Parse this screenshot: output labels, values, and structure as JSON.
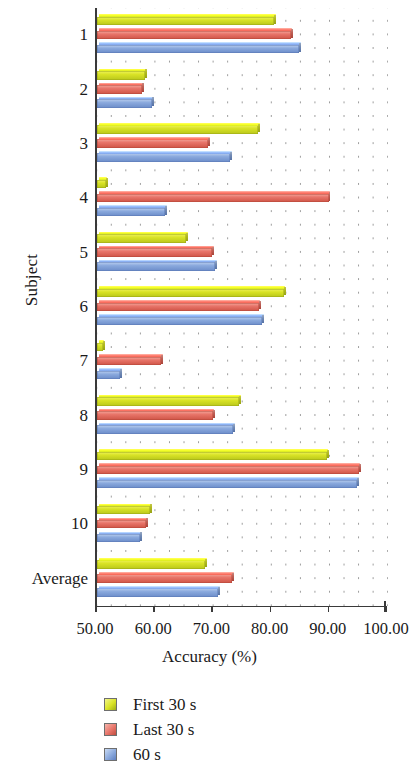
{
  "chart_data": {
    "type": "bar",
    "orientation": "horizontal",
    "title": "",
    "xlabel": "Accuracy (%)",
    "ylabel": "Subject",
    "xlim": [
      50.0,
      100.0
    ],
    "xticks": [
      50.0,
      60.0,
      70.0,
      80.0,
      90.0,
      100.0
    ],
    "xtick_labels": [
      "50.00",
      "60.00",
      "70.00",
      "80.00",
      "90.00",
      "100.00"
    ],
    "grid": "dotted",
    "legend_position": "below",
    "categories": [
      "1",
      "2",
      "3",
      "4",
      "5",
      "6",
      "7",
      "8",
      "9",
      "10",
      "Average"
    ],
    "series": [
      {
        "name": "First 30 s",
        "color": "#d9e326",
        "values": [
          80.4,
          58.2,
          77.7,
          51.5,
          65.3,
          82.1,
          51.0,
          74.4,
          89.5,
          59.1,
          68.6
        ]
      },
      {
        "name": "Last 30 s",
        "color": "#e8756a",
        "values": [
          83.3,
          57.7,
          69.1,
          89.8,
          69.8,
          77.8,
          61.0,
          69.9,
          95.0,
          58.4,
          73.2
        ]
      },
      {
        "name": "60 s",
        "color": "#8aa9dd",
        "values": [
          84.7,
          59.5,
          72.9,
          61.7,
          70.3,
          78.4,
          54.0,
          73.4,
          94.7,
          57.4,
          70.8
        ]
      }
    ]
  }
}
